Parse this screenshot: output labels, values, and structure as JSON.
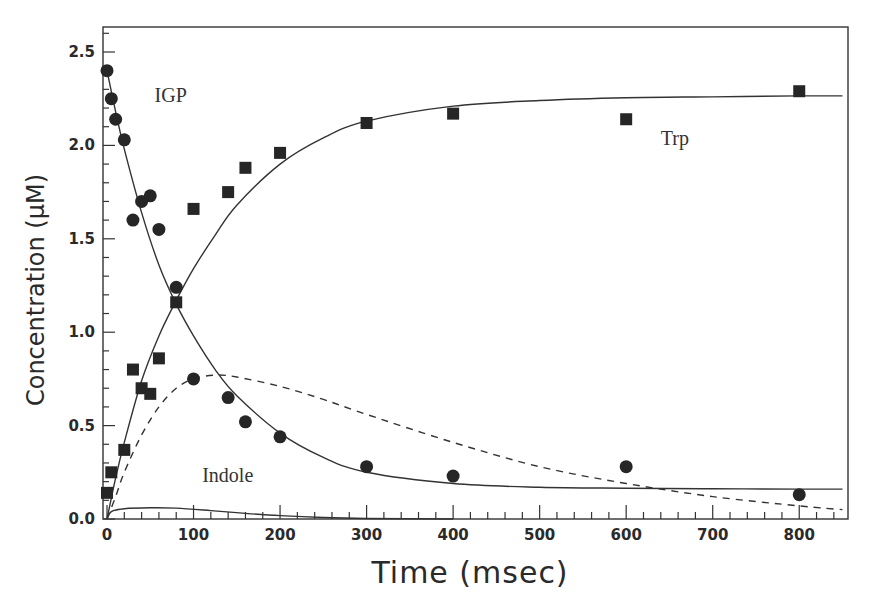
{
  "chart_data": {
    "type": "scatter",
    "title": "",
    "xlabel": "Time (msec)",
    "ylabel": "Concentration (µM)",
    "xlim": [
      -5,
      855
    ],
    "ylim": [
      0,
      2.63
    ],
    "grid": false,
    "x_ticks": [
      0,
      100,
      200,
      300,
      400,
      500,
      600,
      700,
      800
    ],
    "x_tick_labels": [
      "0",
      "100",
      "200",
      "300",
      "400",
      "500",
      "600",
      "700",
      "800"
    ],
    "y_ticks": [
      0.0,
      0.5,
      1.0,
      1.5,
      2.0,
      2.5
    ],
    "y_tick_labels": [
      "0.0",
      "0.5",
      "1.0",
      "1.5",
      "2.0",
      "2.5"
    ],
    "annotations": [
      {
        "text": "IGP",
        "x": 55,
        "y": 2.23
      },
      {
        "text": "Trp",
        "x": 640,
        "y": 2.0
      },
      {
        "text": "Indole",
        "x": 110,
        "y": 0.2
      }
    ],
    "series": [
      {
        "name": "IGP",
        "kind": "points",
        "marker": "circle",
        "x": [
          0,
          5,
          10,
          20,
          30,
          40,
          50,
          60,
          80,
          100,
          140,
          160,
          200,
          300,
          400,
          600,
          800
        ],
        "y": [
          2.4,
          2.25,
          2.14,
          2.03,
          1.6,
          1.7,
          1.73,
          1.55,
          1.24,
          0.75,
          0.65,
          0.52,
          0.44,
          0.28,
          0.23,
          0.28,
          0.13
        ]
      },
      {
        "name": "Trp",
        "kind": "points",
        "marker": "square",
        "x": [
          0,
          5,
          20,
          30,
          40,
          50,
          60,
          80,
          100,
          140,
          160,
          200,
          300,
          400,
          600,
          800
        ],
        "y": [
          0.14,
          0.25,
          0.37,
          0.8,
          0.7,
          0.67,
          0.86,
          1.16,
          1.66,
          1.75,
          1.88,
          1.96,
          2.12,
          2.17,
          2.14,
          2.29
        ]
      },
      {
        "name": "IGP fit",
        "kind": "line",
        "style": "solid",
        "x": [
          0,
          10,
          20,
          40,
          60,
          80,
          100,
          125,
          150,
          200,
          250,
          300,
          400,
          500,
          600,
          700,
          800,
          850
        ],
        "y": [
          2.4,
          2.18,
          1.98,
          1.64,
          1.36,
          1.15,
          0.98,
          0.8,
          0.66,
          0.46,
          0.33,
          0.25,
          0.19,
          0.17,
          0.165,
          0.162,
          0.16,
          0.16
        ]
      },
      {
        "name": "Trp fit",
        "kind": "line",
        "style": "solid",
        "x": [
          0,
          10,
          20,
          40,
          60,
          80,
          100,
          125,
          150,
          200,
          250,
          300,
          400,
          500,
          600,
          700,
          800,
          850
        ],
        "y": [
          0.0,
          0.22,
          0.41,
          0.74,
          0.98,
          1.17,
          1.34,
          1.52,
          1.68,
          1.9,
          2.04,
          2.13,
          2.21,
          2.24,
          2.255,
          2.26,
          2.265,
          2.265
        ]
      },
      {
        "name": "Indole (dashed fit)",
        "kind": "line",
        "style": "dashed",
        "x": [
          0,
          10,
          20,
          40,
          60,
          80,
          100,
          125,
          150,
          200,
          250,
          300,
          400,
          500,
          600,
          700,
          800,
          850
        ],
        "y": [
          0.0,
          0.12,
          0.25,
          0.45,
          0.6,
          0.7,
          0.75,
          0.77,
          0.76,
          0.71,
          0.64,
          0.56,
          0.41,
          0.28,
          0.19,
          0.12,
          0.07,
          0.05
        ]
      },
      {
        "name": "Indole fit",
        "kind": "line",
        "style": "solid",
        "x": [
          0,
          5,
          20,
          50,
          80,
          120,
          160,
          200,
          250,
          300,
          400
        ],
        "y": [
          0.0,
          0.04,
          0.055,
          0.06,
          0.058,
          0.045,
          0.03,
          0.018,
          0.008,
          0.003,
          0.0
        ]
      }
    ]
  }
}
